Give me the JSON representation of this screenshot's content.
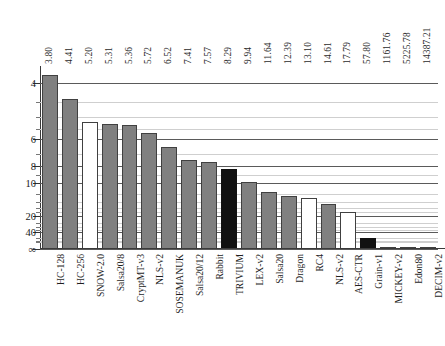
{
  "chart_data": {
    "type": "bar",
    "title": "",
    "subtitle": "",
    "xlabel": "",
    "ylabel": "",
    "grid": true,
    "legend": "none",
    "y_axis": {
      "scale": "inverse-log",
      "inverted": true,
      "tick_labels": [
        "4",
        "6",
        "8",
        "10",
        "20",
        "40",
        "∞"
      ],
      "tick_values": [
        4,
        6,
        8,
        10,
        20,
        40,
        null
      ],
      "minor_tick_values": [
        4.5,
        5,
        5.5,
        7,
        9,
        12,
        14,
        16,
        18,
        25,
        30,
        35,
        60,
        80,
        100
      ],
      "note": "axis increases downward; bar height proportional to 1/value"
    },
    "categories": [
      "HC-128",
      "HC-256",
      "SNOW-2.0",
      "Salsa20/8",
      "CryptMT-v3",
      "NLS-v2",
      "SOSEMANUK",
      "Salsa20/12",
      "Rabbit",
      "TRIVIUM",
      "LEX-v2",
      "Salsa20",
      "Dragon",
      "RC4",
      "NLS-v2",
      "AES-CTR",
      "Grain-v1",
      "MICKEY-v2",
      "Edon80",
      "DECIM-v2"
    ],
    "values": [
      3.8,
      4.41,
      5.2,
      5.31,
      5.36,
      5.72,
      6.52,
      7.41,
      7.57,
      8.29,
      9.94,
      11.64,
      12.39,
      13.1,
      14.61,
      17.79,
      57.8,
      1161.76,
      5225.78,
      14387.21
    ],
    "value_labels": [
      "3.80",
      "4.41",
      "5.20",
      "5.31",
      "5.36",
      "5.72",
      "6.52",
      "7.41",
      "7.57",
      "8.29",
      "9.94",
      "11.64",
      "12.39",
      "13.10",
      "14.61",
      "17.79",
      "57.80",
      "1161.76",
      "5225.78",
      "14387.21"
    ],
    "bar_colors": [
      "gray",
      "gray",
      "white",
      "gray",
      "gray",
      "gray",
      "gray",
      "gray",
      "gray",
      "black",
      "gray",
      "gray",
      "gray",
      "white",
      "gray",
      "white",
      "black",
      "gray",
      "gray",
      "gray"
    ],
    "colors": {
      "gray": "#808080",
      "white": "#ffffff",
      "black": "#111111",
      "outline": "#404040",
      "grid_major": "#5a5a5a",
      "grid_minor": "#cfcfcf",
      "axis": "#3a3a3a"
    }
  }
}
